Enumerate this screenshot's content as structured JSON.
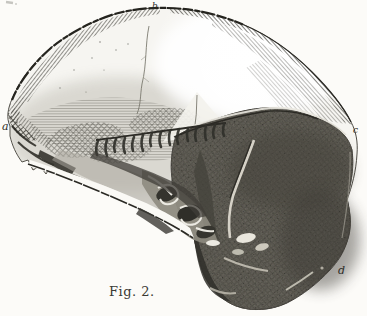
{
  "figure": {
    "caption": "Fig. 2.",
    "labels": {
      "a": "a",
      "b": "b",
      "c": "c",
      "d": "d"
    },
    "alt": "Wood engraving of a fossil human skull in left profile; light shaded cranium with a dark stone matrix covering the facial region"
  },
  "colors": {
    "paper": "#fcfbf8",
    "bone": "#f6f5f1",
    "ink": "#25241f",
    "matrix": "#53514a"
  }
}
